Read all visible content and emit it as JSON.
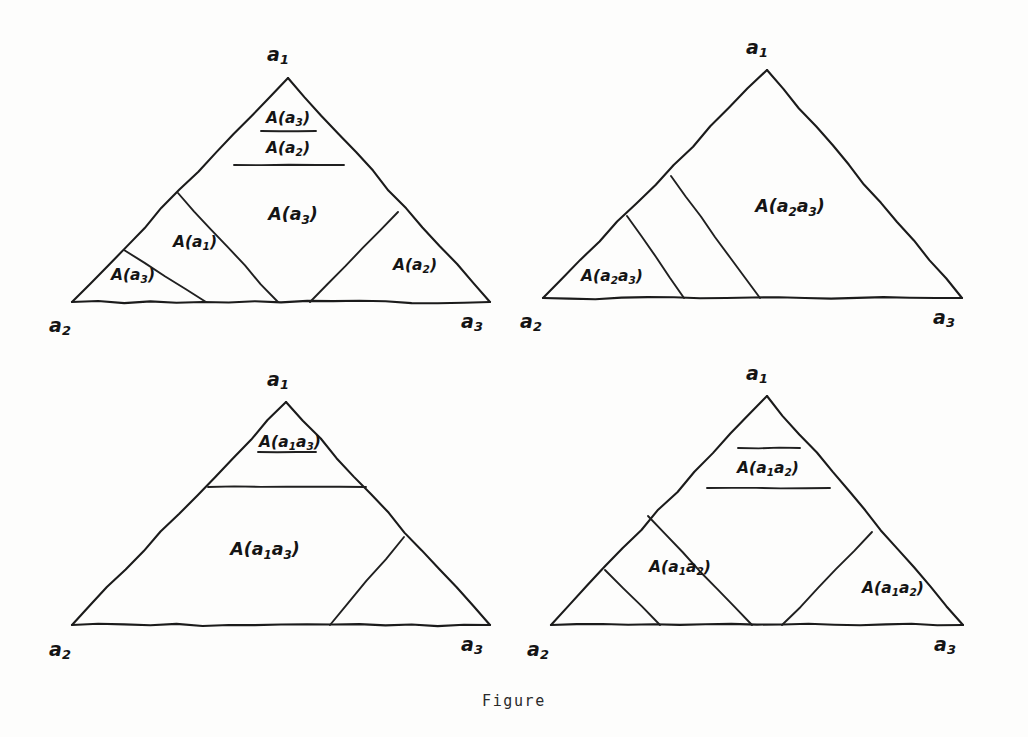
{
  "caption": {
    "text": "Figure",
    "top_px": 692
  },
  "colors": {
    "background": "#fdfdfc",
    "ink": "#1b1b1b",
    "label_ink": "#141414"
  },
  "panels": [
    {
      "id": "top-left",
      "name": "panel-top-left",
      "vertices": {
        "apex": {
          "label_base": "a",
          "label_sub": "1",
          "x": 288,
          "y": 78
        },
        "left": {
          "label_base": "a",
          "label_sub": "2",
          "x": 72,
          "y": 302
        },
        "right": {
          "label_base": "a",
          "label_sub": "3",
          "x": 490,
          "y": 302
        }
      },
      "vertex_labels": [
        {
          "name": "vertex-label-a1",
          "base": "a",
          "sub": "1",
          "x": 278,
          "y": 55
        },
        {
          "name": "vertex-label-a2",
          "base": "a",
          "sub": "2",
          "x": 60,
          "y": 326
        },
        {
          "name": "vertex-label-a3",
          "base": "a",
          "sub": "3",
          "x": 472,
          "y": 322
        }
      ],
      "regions": [
        {
          "name": "region-label-A-a3-apex",
          "base": "A(a",
          "sub": "3",
          "tail": ")",
          "x": 288,
          "y": 118,
          "size": "small"
        },
        {
          "name": "region-label-A-a2-band",
          "base": "A(a",
          "sub": "2",
          "tail": ")",
          "x": 288,
          "y": 148,
          "size": "small"
        },
        {
          "name": "region-label-A-a3-center",
          "base": "A(a",
          "sub": "3",
          "tail": ")",
          "x": 293,
          "y": 215,
          "size": "normal"
        },
        {
          "name": "region-label-A-a1-left",
          "base": "A(a",
          "sub": "1",
          "tail": ")",
          "x": 195,
          "y": 242,
          "size": "small"
        },
        {
          "name": "region-label-A-a3-corner",
          "base": "A(a",
          "sub": "3",
          "tail": ")",
          "x": 133,
          "y": 275,
          "size": "small"
        },
        {
          "name": "region-label-A-a2-corner",
          "base": "A(a",
          "sub": "2",
          "tail": ")",
          "x": 415,
          "y": 265,
          "size": "small"
        }
      ],
      "internal_lines": [
        {
          "name": "cut-apex-upper",
          "kind": "horizontal",
          "x1": 261,
          "y1": 131,
          "x2": 316,
          "y2": 131
        },
        {
          "name": "cut-apex-lower",
          "kind": "horizontal",
          "x1": 234,
          "y1": 165,
          "x2": 344,
          "y2": 165
        },
        {
          "name": "cut-left-outer",
          "kind": "diagonal",
          "x1": 124,
          "y1": 250,
          "x2": 206,
          "y2": 302
        },
        {
          "name": "cut-left-inner",
          "kind": "diagonal",
          "x1": 178,
          "y1": 193,
          "x2": 278,
          "y2": 302
        },
        {
          "name": "cut-right",
          "kind": "diagonal",
          "x1": 398,
          "y1": 212,
          "x2": 310,
          "y2": 302
        }
      ]
    },
    {
      "id": "top-right",
      "name": "panel-top-right",
      "vertices": {
        "apex": {
          "label_base": "a",
          "label_sub": "1",
          "x": 767,
          "y": 70
        },
        "left": {
          "label_base": "a",
          "label_sub": "2",
          "x": 543,
          "y": 298
        },
        "right": {
          "label_base": "a",
          "label_sub": "3",
          "x": 962,
          "y": 298
        }
      },
      "vertex_labels": [
        {
          "name": "vertex-label-a1",
          "base": "a",
          "sub": "1",
          "x": 757,
          "y": 48
        },
        {
          "name": "vertex-label-a2",
          "base": "a",
          "sub": "2",
          "x": 531,
          "y": 322
        },
        {
          "name": "vertex-label-a3",
          "base": "a",
          "sub": "3",
          "x": 944,
          "y": 318
        }
      ],
      "regions": [
        {
          "name": "region-label-A-a2a3-main",
          "base": "A(a",
          "sub": "2",
          "mid": "a",
          "sub2": "3",
          "tail": ")",
          "x": 790,
          "y": 207,
          "size": "normal"
        },
        {
          "name": "region-label-A-a2a3-corner",
          "base": "A(a",
          "sub": "2",
          "mid": "a",
          "sub2": "3",
          "tail": ")",
          "x": 612,
          "y": 276,
          "size": "small"
        }
      ],
      "internal_lines": [
        {
          "name": "cut-left-outer",
          "kind": "diagonal",
          "x1": 627,
          "y1": 216,
          "x2": 684,
          "y2": 298
        },
        {
          "name": "cut-left-inner",
          "kind": "diagonal",
          "x1": 671,
          "y1": 176,
          "x2": 760,
          "y2": 298
        }
      ]
    },
    {
      "id": "bottom-left",
      "name": "panel-bottom-left",
      "vertices": {
        "apex": {
          "label_base": "a",
          "label_sub": "1",
          "x": 286,
          "y": 402
        },
        "left": {
          "label_base": "a",
          "label_sub": "2",
          "x": 72,
          "y": 625
        },
        "right": {
          "label_base": "a",
          "label_sub": "3",
          "x": 490,
          "y": 625
        }
      },
      "vertex_labels": [
        {
          "name": "vertex-label-a1",
          "base": "a",
          "sub": "1",
          "x": 278,
          "y": 380
        },
        {
          "name": "vertex-label-a2",
          "base": "a",
          "sub": "2",
          "x": 60,
          "y": 650
        },
        {
          "name": "vertex-label-a3",
          "base": "a",
          "sub": "3",
          "x": 472,
          "y": 645
        }
      ],
      "regions": [
        {
          "name": "region-label-A-a1a3-apex",
          "base": "A(a",
          "sub": "1",
          "mid": "a",
          "sub2": "3",
          "tail": ")",
          "x": 290,
          "y": 442,
          "size": "small"
        },
        {
          "name": "region-label-A-a1a3-main",
          "base": "A(a",
          "sub": "1",
          "mid": "a",
          "sub2": "3",
          "tail": ")",
          "x": 265,
          "y": 550,
          "size": "normal"
        }
      ],
      "internal_lines": [
        {
          "name": "cut-apex-upper",
          "kind": "horizontal",
          "x1": 258,
          "y1": 452,
          "x2": 316,
          "y2": 452
        },
        {
          "name": "cut-apex-lower",
          "kind": "horizontal",
          "x1": 208,
          "y1": 487,
          "x2": 366,
          "y2": 487
        },
        {
          "name": "cut-right",
          "kind": "diagonal",
          "x1": 404,
          "y1": 537,
          "x2": 330,
          "y2": 625
        }
      ]
    },
    {
      "id": "bottom-right",
      "name": "panel-bottom-right",
      "vertices": {
        "apex": {
          "label_base": "a",
          "label_sub": "1",
          "x": 767,
          "y": 396
        },
        "left": {
          "label_base": "a",
          "label_sub": "2",
          "x": 551,
          "y": 625
        },
        "right": {
          "label_base": "a",
          "label_sub": "3",
          "x": 963,
          "y": 625
        }
      },
      "vertex_labels": [
        {
          "name": "vertex-label-a1",
          "base": "a",
          "sub": "1",
          "x": 757,
          "y": 374
        },
        {
          "name": "vertex-label-a2",
          "base": "a",
          "sub": "2",
          "x": 538,
          "y": 650
        },
        {
          "name": "vertex-label-a3",
          "base": "a",
          "sub": "3",
          "x": 945,
          "y": 645
        }
      ],
      "regions": [
        {
          "name": "region-label-A-a1a2-band",
          "base": "A(a",
          "sub": "1",
          "mid": "a",
          "sub2": "2",
          "tail": ")",
          "x": 768,
          "y": 468,
          "size": "small"
        },
        {
          "name": "region-label-A-a1a2-left",
          "base": "A(a",
          "sub": "1",
          "mid": "a",
          "sub2": "2",
          "tail": ")",
          "x": 680,
          "y": 567,
          "size": "small"
        },
        {
          "name": "region-label-A-a1a2-right",
          "base": "A(a",
          "sub": "1",
          "mid": "a",
          "sub2": "2",
          "tail": ")",
          "x": 893,
          "y": 588,
          "size": "small"
        }
      ],
      "internal_lines": [
        {
          "name": "cut-apex-upper",
          "kind": "horizontal",
          "x1": 738,
          "y1": 448,
          "x2": 800,
          "y2": 448
        },
        {
          "name": "cut-apex-lower",
          "kind": "horizontal",
          "x1": 707,
          "y1": 488,
          "x2": 830,
          "y2": 488
        },
        {
          "name": "cut-left-outer",
          "kind": "diagonal",
          "x1": 605,
          "y1": 570,
          "x2": 660,
          "y2": 625
        },
        {
          "name": "cut-left-inner",
          "kind": "diagonal",
          "x1": 648,
          "y1": 516,
          "x2": 752,
          "y2": 625
        },
        {
          "name": "cut-right",
          "kind": "diagonal",
          "x1": 872,
          "y1": 532,
          "x2": 782,
          "y2": 625
        }
      ]
    }
  ]
}
